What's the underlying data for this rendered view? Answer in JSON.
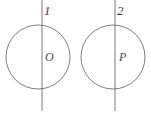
{
  "figure": {
    "background_color": "#ffffff",
    "stroke_color": "#6e6e6e",
    "label_color": "#4a4a4a",
    "width": 151,
    "height": 115,
    "shapes": [
      {
        "id": "circle-1",
        "type": "circle",
        "cx": 38,
        "cy": 57,
        "r": 32,
        "center_label": "O",
        "line_label": "1"
      },
      {
        "id": "circle-2",
        "type": "circle",
        "cx": 113,
        "cy": 57,
        "r": 32,
        "center_label": "P",
        "line_label": "2"
      }
    ],
    "lines": [
      {
        "id": "line-1",
        "type": "vertical-line",
        "x": 42,
        "y1": 0,
        "y2": 111,
        "label": "1"
      },
      {
        "id": "line-2",
        "type": "vertical-line",
        "x": 115,
        "y1": 0,
        "y2": 111,
        "label": "2"
      }
    ],
    "labels": {
      "line_1": "1",
      "line_2": "2",
      "center_1": "O",
      "center_2": "P"
    }
  }
}
